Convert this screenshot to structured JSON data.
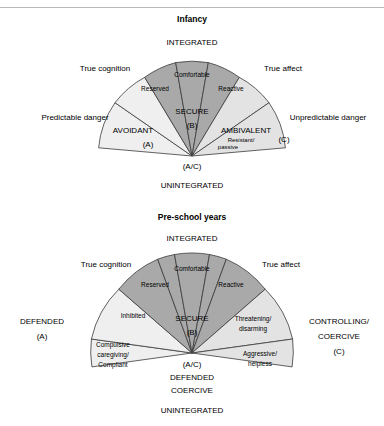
{
  "header": {
    "crumb_left": "· ·",
    "crumb_right": "· ·"
  },
  "diagrams": [
    {
      "id": "infancy",
      "title": "Infancy",
      "top_axis_label": "INTEGRATED",
      "bottom_axis_label": "UNINTEGRATED",
      "apex_label": "(A/C)",
      "left_outer_label": "Predictable danger",
      "right_outer_label": "Unpredictable danger",
      "left_inner_label": "True cognition",
      "right_inner_label": "True affect",
      "center_label_line1": "SECURE",
      "center_label_line2": "(B)",
      "sectors": [
        {
          "name": "AVOIDANT",
          "code": "(A)",
          "shade": "light"
        },
        {
          "name": "Reserved",
          "shade": "dark"
        },
        {
          "name": "Comfortable",
          "shade": "dark"
        },
        {
          "name": "Reactive",
          "shade": "dark"
        },
        {
          "name": "AMBIVALENT",
          "code": "(C)",
          "shade": "light"
        },
        {
          "name": "Resistant/ passive",
          "shade": "light"
        }
      ]
    },
    {
      "id": "preschool",
      "title": "Pre-school years",
      "top_axis_label": "INTEGRATED",
      "bottom_axis_label": "UNINTEGRATED",
      "apex_label": "(A/C)",
      "apex_sub_line1": "DEFENDED",
      "apex_sub_line2": "COERCIVE",
      "left_outer_label_line1": "DEFENDED",
      "left_outer_label_line2": "(A)",
      "right_outer_label_line1": "CONTROLLING/",
      "right_outer_label_line2": "COERCIVE",
      "right_outer_label_line3": "(C)",
      "left_inner_label": "True cognition",
      "right_inner_label": "True affect",
      "center_label_line1": "SECURE",
      "center_label_line2": "(B)",
      "sectors": [
        {
          "name": "Compulsive caregiving/ Compliant",
          "shade": "light"
        },
        {
          "name": "Inhibited",
          "shade": "light"
        },
        {
          "name": "Reserved",
          "shade": "dark"
        },
        {
          "name": "Comfortable",
          "shade": "dark"
        },
        {
          "name": "Reactive",
          "shade": "dark"
        },
        {
          "name": "Threatening/ disarming",
          "shade": "light"
        },
        {
          "name": "Aggressive/ helpless",
          "shade": "light"
        }
      ]
    }
  ],
  "colors": {
    "dark_fill": "#a9a9a9",
    "light_fill": "#efefef",
    "mid_fill": "#e3e3e3",
    "stroke": "#3a3a3a"
  },
  "text": {
    "infancy": {
      "title": "Infancy",
      "integrated": "INTEGRATED",
      "unintegrated": "UNINTEGRATED",
      "true_cognition": "True cognition",
      "true_affect": "True affect",
      "predictable": "Predictable danger",
      "unpredictable": "Unpredictable danger",
      "comfortable": "Comfortable",
      "reserved": "Reserved",
      "reactive": "Reactive",
      "secure": "SECURE",
      "secure_code": "(B)",
      "avoidant": "AVOIDANT",
      "avoidant_code": "(A)",
      "ambivalent": "AMBIVALENT",
      "ambivalent_code": "(C)",
      "resistant1": "Resistant/",
      "resistant2": "passive",
      "apex": "(A/C)"
    },
    "preschool": {
      "title": "Pre-school years",
      "integrated": "INTEGRATED",
      "unintegrated": "UNINTEGRATED",
      "true_cognition": "True cognition",
      "true_affect": "True affect",
      "defended1": "DEFENDED",
      "defended2": "(A)",
      "controlling1": "CONTROLLING/",
      "controlling2": "COERCIVE",
      "controlling3": "(C)",
      "comfortable": "Comfortable",
      "reserved": "Reserved",
      "reactive": "Reactive",
      "secure": "SECURE",
      "secure_code": "(B)",
      "inhibited": "Inhibited",
      "compulsive1": "Compulsive",
      "compulsive2": "caregiving/",
      "compulsive3": "Compliant",
      "threatening1": "Threatening/",
      "threatening2": "disarming",
      "aggressive1": "Aggressive/",
      "aggressive2": "helpless",
      "apex": "(A/C)",
      "apex_sub1": "DEFENDED",
      "apex_sub2": "COERCIVE"
    }
  }
}
